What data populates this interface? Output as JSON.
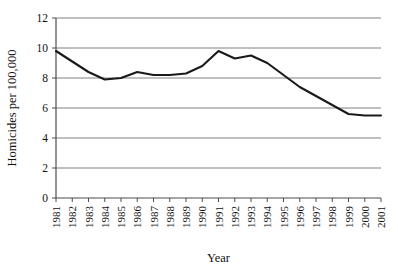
{
  "chart_data": {
    "type": "line",
    "title": "",
    "xlabel": "Year",
    "ylabel": "Homicides per 100,000",
    "categories": [
      "1981",
      "1982",
      "1983",
      "1984",
      "1985",
      "1986",
      "1987",
      "1988",
      "1989",
      "1990",
      "1991",
      "1992",
      "1993",
      "1994",
      "1995",
      "1996",
      "1997",
      "1998",
      "1999",
      "2000",
      "2001"
    ],
    "values": [
      9.8,
      9.1,
      8.4,
      7.9,
      8.0,
      8.4,
      8.2,
      8.2,
      8.3,
      8.8,
      9.8,
      9.3,
      9.5,
      9.0,
      8.2,
      7.4,
      6.8,
      6.2,
      5.6,
      5.5,
      5.5
    ],
    "ylim": [
      0,
      12
    ],
    "yticks": [
      0,
      2,
      4,
      6,
      8,
      10,
      12
    ],
    "ytick_labels": [
      "0",
      "2",
      "4",
      "6",
      "8",
      "10",
      "12"
    ],
    "grid": true,
    "legend": "none",
    "series": [
      {
        "name": "Homicides per 100,000",
        "color": "#1a1a1a",
        "values": [
          9.8,
          9.1,
          8.4,
          7.9,
          8.0,
          8.4,
          8.2,
          8.2,
          8.3,
          8.8,
          9.8,
          9.3,
          9.5,
          9.0,
          8.2,
          7.4,
          6.8,
          6.2,
          5.6,
          5.5,
          5.5
        ]
      }
    ]
  },
  "axis_title_x": "Year",
  "axis_title_y": "Homicides per 100,000"
}
